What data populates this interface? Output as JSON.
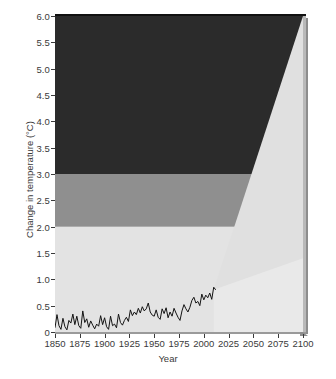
{
  "chart_data": {
    "type": "area",
    "title": "",
    "xlabel": "Year",
    "ylabel": "Change in temperature (°C)",
    "xlim": [
      1850,
      2100
    ],
    "ylim": [
      0,
      6.0
    ],
    "grid": false,
    "legend_position": "none",
    "xticks": [
      1850,
      1875,
      1900,
      1925,
      1950,
      1975,
      2000,
      2025,
      2050,
      2075,
      2100
    ],
    "xtick_labels": [
      "1850",
      "1875",
      "1900",
      "1925",
      "1950",
      "1975",
      "2000",
      "2025",
      "2050",
      "2075",
      "2100"
    ],
    "yticks": [
      0,
      0.5,
      1.0,
      1.5,
      2.0,
      2.5,
      3.0,
      3.5,
      4.0,
      4.5,
      5.0,
      5.5,
      6.0
    ],
    "ytick_labels": [
      "0",
      "0.5",
      "1.0",
      "1.5",
      "2.0",
      "2.5",
      "3.0",
      "3.5",
      "4.0",
      "4.5",
      "5.0",
      "5.5",
      "6.0"
    ],
    "bands": [
      {
        "name": "low-risk-band",
        "from": 0.0,
        "to": 2.0,
        "color": "#e3e3e3"
      },
      {
        "name": "moderate-risk-band",
        "from": 2.0,
        "to": 3.0,
        "color": "#8f8f8f"
      },
      {
        "name": "high-risk-band",
        "from": 3.0,
        "to": 6.0,
        "color": "#2b2b2b"
      }
    ],
    "projection_cone": {
      "name": "projection-uncertainty-cone",
      "color": "#e0e0e0",
      "start_year": 2010,
      "start_value": 0.8,
      "upper_end_year": 2100,
      "upper_end_value": 6.0,
      "lower_end_year": 2100,
      "lower_end_value": 1.4
    },
    "series": [
      {
        "name": "Observed global mean temperature anomaly",
        "type": "line",
        "color": "#141414",
        "x": [
          1850,
          1852,
          1854,
          1856,
          1858,
          1860,
          1862,
          1864,
          1866,
          1868,
          1870,
          1872,
          1874,
          1876,
          1878,
          1880,
          1882,
          1884,
          1886,
          1888,
          1890,
          1892,
          1894,
          1896,
          1898,
          1900,
          1902,
          1904,
          1906,
          1908,
          1910,
          1912,
          1914,
          1916,
          1918,
          1920,
          1922,
          1924,
          1926,
          1928,
          1930,
          1932,
          1934,
          1936,
          1938,
          1940,
          1942,
          1944,
          1946,
          1948,
          1950,
          1952,
          1954,
          1956,
          1958,
          1960,
          1962,
          1964,
          1966,
          1968,
          1970,
          1972,
          1974,
          1976,
          1978,
          1980,
          1982,
          1984,
          1986,
          1988,
          1990,
          1992,
          1994,
          1996,
          1998,
          2000,
          2002,
          2004,
          2006,
          2008,
          2010,
          2012
        ],
        "values": [
          0.08,
          0.33,
          0.12,
          0.05,
          0.26,
          0.1,
          0.04,
          0.22,
          0.17,
          0.34,
          0.14,
          0.3,
          0.12,
          0.07,
          0.4,
          0.18,
          0.25,
          0.09,
          0.21,
          0.13,
          0.06,
          0.15,
          0.11,
          0.31,
          0.14,
          0.27,
          0.1,
          0.05,
          0.3,
          0.12,
          0.15,
          0.08,
          0.34,
          0.18,
          0.13,
          0.22,
          0.28,
          0.2,
          0.42,
          0.31,
          0.38,
          0.33,
          0.45,
          0.36,
          0.48,
          0.4,
          0.44,
          0.55,
          0.38,
          0.32,
          0.3,
          0.42,
          0.28,
          0.24,
          0.44,
          0.35,
          0.46,
          0.27,
          0.38,
          0.3,
          0.45,
          0.36,
          0.28,
          0.22,
          0.4,
          0.52,
          0.44,
          0.38,
          0.47,
          0.6,
          0.66,
          0.55,
          0.58,
          0.5,
          0.72,
          0.61,
          0.7,
          0.65,
          0.74,
          0.62,
          0.85,
          0.8
        ]
      }
    ]
  }
}
